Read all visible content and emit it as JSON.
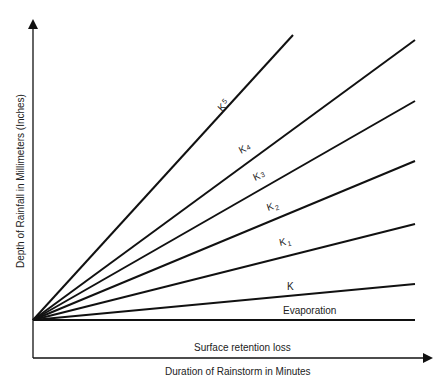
{
  "diagram": {
    "type": "line-fan diagram",
    "x_axis_label": "Duration of Rainstorm in Minutes",
    "y_axis_label": "Depth of Rainfall in Millimeters (Inches)",
    "baseline_band_label": "Surface retention loss",
    "lines": [
      {
        "id": "k5",
        "label": "K",
        "subscript": "5"
      },
      {
        "id": "k4",
        "label": "K",
        "subscript": "4"
      },
      {
        "id": "k3",
        "label": "K",
        "subscript": "3"
      },
      {
        "id": "k2",
        "label": "K",
        "subscript": "2"
      },
      {
        "id": "k1",
        "label": "K",
        "subscript": "1"
      },
      {
        "id": "k",
        "label": "K",
        "subscript": ""
      },
      {
        "id": "evaporation",
        "label": "Evaporation",
        "subscript": ""
      }
    ]
  }
}
